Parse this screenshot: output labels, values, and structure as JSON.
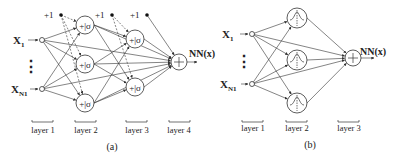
{
  "panel_a": {
    "caption": "(a)",
    "inputs": [
      "X1",
      "XN1"
    ],
    "input_sub": [
      "1",
      "N1"
    ],
    "ellipsis": "⋮",
    "bias_label": "+1",
    "hidden_node_symbol": "+|σ",
    "output_symbol": "+",
    "output_label": "NN(x)",
    "layers": [
      "layer 1",
      "layer 2",
      "layer 3",
      "layer 4"
    ]
  },
  "panel_b": {
    "caption": "(b)",
    "inputs": [
      "X1",
      "XN1"
    ],
    "input_sub": [
      "1",
      "N1"
    ],
    "ellipsis": "⋮",
    "hidden_node_symbol": "radial-basis",
    "output_symbol": "+",
    "output_label": "NN(x)",
    "layers": [
      "layer 1",
      "layer 2",
      "layer 3"
    ]
  }
}
